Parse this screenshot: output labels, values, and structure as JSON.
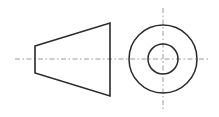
{
  "drawing": {
    "title": "Two-view orthographic drawing: truncated cone",
    "canvas": {
      "width": 219,
      "height": 117,
      "background": "#ffffff"
    },
    "colors": {
      "outline": "#2a2a2a",
      "centerline": "#9a9a9a",
      "background": "#ffffff"
    },
    "views": {
      "side_view": {
        "name": "side-view-trapezoid",
        "shape": "trapezoid",
        "points": "35,46 110,23 110,96 35,73",
        "left_edge_top_y": 46,
        "left_edge_bottom_y": 73,
        "right_edge_top_y": 23,
        "right_edge_bottom_y": 96,
        "left_x": 35,
        "right_x": 110
      },
      "front_view": {
        "name": "front-view-circles",
        "center_x": 163,
        "center_y": 59,
        "outer_radius": 34,
        "inner_radius": 15
      }
    },
    "centerlines": {
      "horizontal": {
        "x1": 15,
        "y1": 59,
        "x2": 210,
        "y2": 59
      },
      "vertical": {
        "x1": 163,
        "y1": 8,
        "x2": 163,
        "y2": 110
      }
    }
  }
}
